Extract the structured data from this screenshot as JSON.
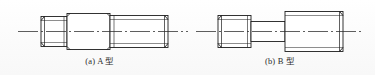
{
  "figure": {
    "kind": "engineering-drawing",
    "line_color": "#1d1d1d",
    "centerline_color": "#2a2a2a",
    "background_color": "#fdfdfd",
    "axis_label": "centerline"
  },
  "parts": [
    {
      "id": "a",
      "caption": "(a) A 型",
      "segments": [
        {
          "name": "left-threaded-end",
          "x": 41,
          "width": 26,
          "half_height": 15,
          "threaded": true
        },
        {
          "name": "middle-plain-shank",
          "x": 67,
          "width": 43,
          "half_height": 18,
          "threaded": false
        },
        {
          "name": "right-threaded-end",
          "x": 110,
          "width": 58,
          "half_height": 16,
          "threaded": true
        }
      ]
    },
    {
      "id": "b",
      "caption": "(b) B 型",
      "segments": [
        {
          "name": "left-threaded-end",
          "x": 218,
          "width": 33,
          "half_height": 16,
          "threaded": true
        },
        {
          "name": "middle-narrow-shank",
          "x": 251,
          "width": 34,
          "half_height": 10,
          "threaded": false
        },
        {
          "name": "right-threaded-end",
          "x": 285,
          "width": 58,
          "half_height": 20,
          "threaded": true
        }
      ]
    }
  ],
  "captions": {
    "a": "(a) A 型",
    "b": "(b) B 型"
  }
}
